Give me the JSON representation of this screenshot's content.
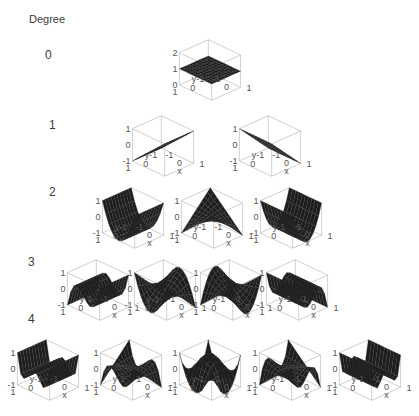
{
  "title": "Degree",
  "rows": [
    {
      "label": "0",
      "label_pos": [
        45,
        48
      ]
    },
    {
      "label": "1",
      "label_pos": [
        49,
        118
      ]
    },
    {
      "label": "2",
      "label_pos": [
        49,
        185
      ]
    },
    {
      "label": "3",
      "label_pos": [
        28,
        255
      ]
    },
    {
      "label": "4",
      "label_pos": [
        28,
        312
      ]
    }
  ],
  "axis_ticks": {
    "z_top": "1",
    "z_mid": "0",
    "z_bot": "-1",
    "y_far": "1",
    "y_mid": "0",
    "y_near": "y-1",
    "x_near": "-1",
    "x_mid": "0",
    "x_far": "1",
    "x_label": "x"
  },
  "degree0_ticks": {
    "z_top": "2",
    "z_mid": "1",
    "z_bot": "0"
  },
  "plots": [
    {
      "row": 0,
      "cx": 210,
      "cy": 70,
      "surface": "const",
      "zmin": 0,
      "zmax": 2
    },
    {
      "row": 1,
      "cx": 163,
      "cy": 146,
      "surface": "x",
      "zmin": -1,
      "zmax": 1
    },
    {
      "row": 1,
      "cx": 270,
      "cy": 146,
      "surface": "y",
      "zmin": -1,
      "zmax": 1
    },
    {
      "row": 2,
      "cx": 133,
      "cy": 218,
      "surface": "x2",
      "zmin": -1,
      "zmax": 1
    },
    {
      "row": 2,
      "cx": 212,
      "cy": 218,
      "surface": "xy",
      "zmin": -1,
      "zmax": 1
    },
    {
      "row": 2,
      "cx": 291,
      "cy": 218,
      "surface": "y2",
      "zmin": -1,
      "zmax": 1
    },
    {
      "row": 3,
      "cx": 98,
      "cy": 290,
      "surface": "x3",
      "zmin": -1,
      "zmax": 1
    },
    {
      "row": 3,
      "cx": 165,
      "cy": 290,
      "surface": "x2y",
      "zmin": -1,
      "zmax": 1
    },
    {
      "row": 3,
      "cx": 231,
      "cy": 290,
      "surface": "xy2",
      "zmin": -1,
      "zmax": 1
    },
    {
      "row": 3,
      "cx": 297,
      "cy": 290,
      "surface": "y3",
      "zmin": -1,
      "zmax": 1
    },
    {
      "row": 4,
      "cx": 48,
      "cy": 370,
      "surface": "x4",
      "zmin": -1,
      "zmax": 1
    },
    {
      "row": 4,
      "cx": 131,
      "cy": 370,
      "surface": "x3y",
      "zmin": -1,
      "zmax": 1
    },
    {
      "row": 4,
      "cx": 210,
      "cy": 370,
      "surface": "x2y2",
      "zmin": -1,
      "zmax": 1
    },
    {
      "row": 4,
      "cx": 290,
      "cy": 370,
      "surface": "xy3",
      "zmin": -1,
      "zmax": 1
    },
    {
      "row": 4,
      "cx": 370,
      "cy": 370,
      "surface": "y4",
      "zmin": -1,
      "zmax": 1
    }
  ],
  "colors": {
    "surface": "#1e1e1e",
    "mesh": "#3a3a3a",
    "box": "#b0b0b0",
    "text": "#555555"
  }
}
